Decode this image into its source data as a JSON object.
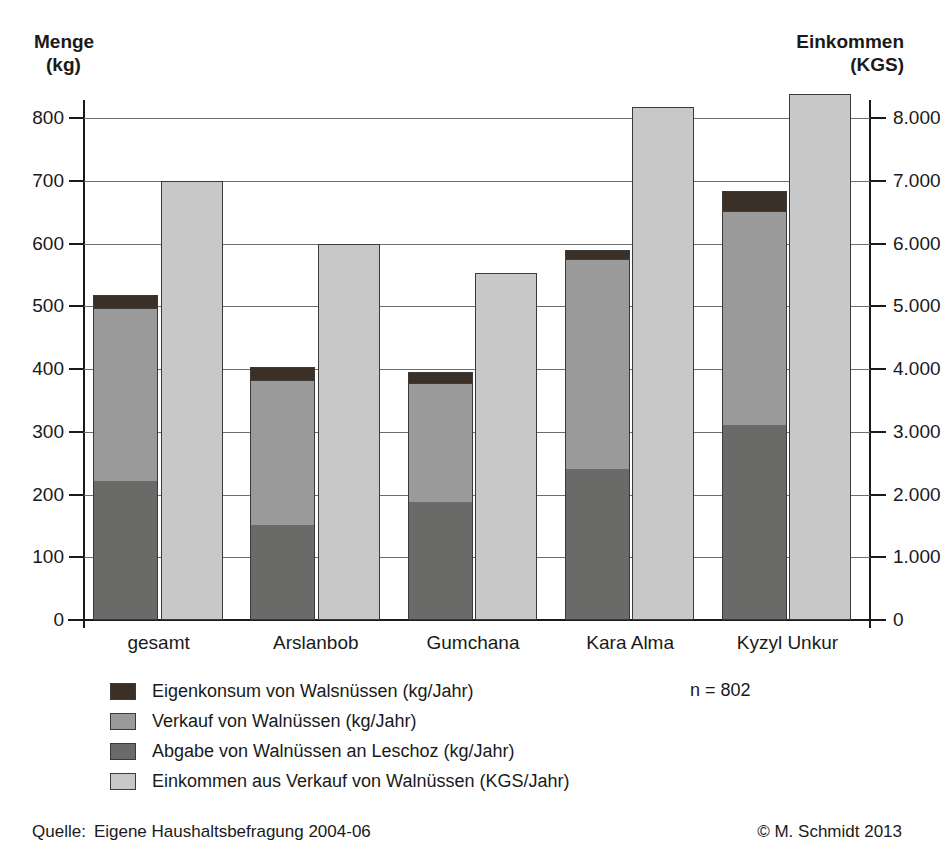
{
  "chart_data": {
    "type": "bar",
    "subtype": "stacked-bar-with-secondary-axis",
    "title": "",
    "categories": [
      "gesamt",
      "Arslanbob",
      "Gumchana",
      "Kara Alma",
      "Kyzyl Unkur"
    ],
    "series": [
      {
        "name": "Abgabe von Walnüssen an Leschoz (kg/Jahr)",
        "axis": "left",
        "stack": "menge",
        "color": "#6a6a68",
        "values": [
          222,
          151,
          188,
          241,
          311
        ]
      },
      {
        "name": "Verkauf von Walnüssen (kg/Jahr)",
        "axis": "left",
        "stack": "menge",
        "color": "#9a9a9a",
        "values": [
          275,
          232,
          190,
          334,
          341
        ]
      },
      {
        "name": "Eigenkonsum von Walsnüssen (kg/Jahr)",
        "axis": "left",
        "stack": "menge",
        "color": "#3a3028",
        "values": [
          21,
          20,
          18,
          15,
          31
        ]
      },
      {
        "name": "Einkommen aus Verkauf von Walnüssen (KGS/Jahr)",
        "axis": "right",
        "stack": "einkommen",
        "color": "#c8c8c8",
        "values": [
          7000,
          6000,
          5530,
          8180,
          8380
        ]
      }
    ],
    "stack_totals_left": [
      518,
      403,
      396,
      590,
      683
    ],
    "left_axis": {
      "label_line1": "Menge",
      "label_line2": "(kg)",
      "min": 0,
      "max": 800,
      "step": 100,
      "ticks": [
        "0",
        "100",
        "200",
        "300",
        "400",
        "500",
        "600",
        "700",
        "800"
      ]
    },
    "right_axis": {
      "label_line1": "Einkommen",
      "label_line2": "(KGS)",
      "min": 0,
      "max": 8000,
      "step": 1000,
      "ticks": [
        "0",
        "1.000",
        "2.000",
        "3.000",
        "4.000",
        "5.000",
        "6.000",
        "7.000",
        "8.000"
      ]
    },
    "grid": true,
    "legend_position": "bottom-left",
    "annotation_n": "n = 802"
  },
  "legend": {
    "items": [
      {
        "label": "Eigenkonsum von Walsnüssen (kg/Jahr)",
        "color": "#3a3028"
      },
      {
        "label": "Verkauf von Walnüssen (kg/Jahr)",
        "color": "#9a9a9a"
      },
      {
        "label": "Abgabe von Walnüssen an Leschoz (kg/Jahr)",
        "color": "#6a6a68"
      },
      {
        "label": "Einkommen aus Verkauf von Walnüssen (KGS/Jahr)",
        "color": "#c8c8c8"
      }
    ]
  },
  "footer": {
    "source_label": "Quelle:",
    "source_text": "Eigene Haushaltsbefragung 2004-06",
    "copyright": "© M. Schmidt 2013"
  },
  "colors": {
    "axis": "#1a1a1a",
    "grid": "#6d6d6d",
    "bar_outline": "#3a3a3a",
    "background": "#ffffff"
  }
}
